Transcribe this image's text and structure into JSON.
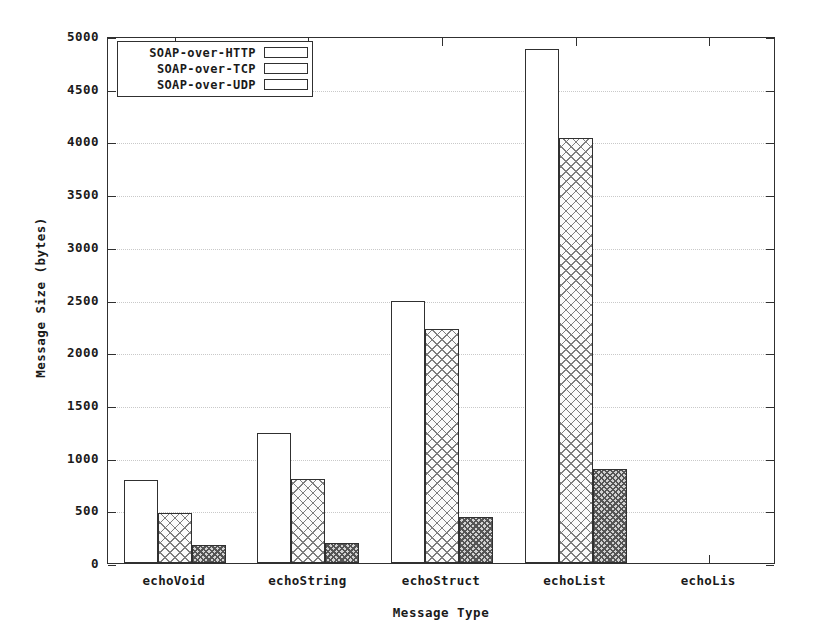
{
  "chart_data": {
    "type": "bar",
    "title": "",
    "xlabel": "Message Type",
    "ylabel": "Message Size (bytes)",
    "categories": [
      "echoVoid",
      "echoString",
      "echoStruct",
      "echoList",
      "echoLis"
    ],
    "series": [
      {
        "name": "SOAP-over-HTTP",
        "fill": "empty",
        "values": [
          790,
          1230,
          2490,
          4880,
          null
        ]
      },
      {
        "name": "SOAP-over-TCP",
        "fill": "crosshatch",
        "values": [
          470,
          800,
          2220,
          4030,
          null
        ]
      },
      {
        "name": "SOAP-over-UDP",
        "fill": "dense",
        "values": [
          170,
          190,
          440,
          890,
          null
        ]
      }
    ],
    "ylim": [
      0,
      5000
    ],
    "yticks": [
      0,
      500,
      1000,
      1500,
      2000,
      2500,
      3000,
      3500,
      4000,
      4500,
      5000
    ],
    "ytick_labels": [
      "0",
      "500",
      "1000",
      "1500",
      "2000",
      "2500",
      "3000",
      "3500",
      "4000",
      "4500",
      "5000"
    ],
    "grid": "horizontal-dotted",
    "legend_position": "top-left-inside",
    "colors": {
      "axis": "#303030",
      "grid": "#c9c9c9",
      "bar_empty": "#ffffff",
      "bar_crosshatch": "#fbfbfb",
      "bar_dense": "#d2d2d2",
      "background": "#ffffff"
    }
  }
}
